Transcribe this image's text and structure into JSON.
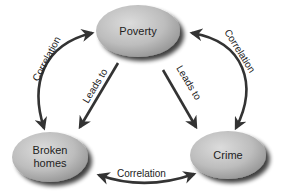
{
  "diagram": {
    "type": "cycle-relationship",
    "nodes": [
      {
        "id": "poverty",
        "label": "Poverty"
      },
      {
        "id": "broken_homes",
        "label_line1": "Broken",
        "label_line2": "homes"
      },
      {
        "id": "crime",
        "label": "Crime"
      }
    ],
    "edges": [
      {
        "from": "poverty",
        "to": "broken_homes",
        "label": "Leads to",
        "style": "straight-arrow"
      },
      {
        "from": "poverty",
        "to": "crime",
        "label": "Leads to",
        "style": "straight-arrow"
      },
      {
        "between": [
          "broken_homes",
          "poverty"
        ],
        "label": "Correlation",
        "style": "curved-double-arrow"
      },
      {
        "between": [
          "poverty",
          "crime"
        ],
        "label": "Correlation",
        "style": "curved-double-arrow"
      },
      {
        "between": [
          "broken_homes",
          "crime"
        ],
        "label": "Correlation",
        "style": "curved-double-arrow"
      }
    ]
  },
  "colors": {
    "node_fill_light": "#d4d4d4",
    "node_fill_dark": "#9a9a9a",
    "arrow": "#333333",
    "text": "#222222"
  }
}
